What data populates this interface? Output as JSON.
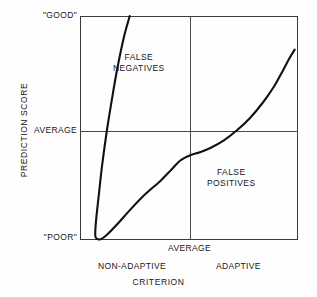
{
  "chart_data": {
    "type": "line",
    "title": "",
    "xlabel": "CRITERION",
    "ylabel": "PREDICTION SCORE",
    "x_tick_labels": [
      "NON-ADAPTIVE",
      "AVERAGE",
      "ADAPTIVE"
    ],
    "y_tick_labels": [
      "\"GOOD\"",
      "AVERAGE",
      "\"POOR\""
    ],
    "xlim": [
      0,
      1
    ],
    "ylim": [
      0,
      1
    ],
    "grid": true,
    "grid_description": "single horizontal line at y=AVERAGE and single vertical line at x=AVERAGE dividing plot into four quadrants",
    "legend": null,
    "annotations": [
      {
        "text": "FALSE NEGATIVES",
        "quadrant": "upper-left"
      },
      {
        "text": "FALSE POSITIVES",
        "quadrant": "lower-right"
      }
    ],
    "series": [
      {
        "name": "prediction-criterion relation",
        "description": "J-shaped / U-shaped curve: steeply descending left branch from top of plot down to a minimum just above the lower-left corner, then rising gradually through the lower-left quadrant, flattening at a shoulder near the vertical AVERAGE line, crossing the horizontal AVERAGE line in the right half, then rising steeply to the upper-right.",
        "points": [
          {
            "x": 0.228,
            "y": 1.0
          },
          {
            "x": 0.2,
            "y": 0.9
          },
          {
            "x": 0.17,
            "y": 0.76
          },
          {
            "x": 0.145,
            "y": 0.62
          },
          {
            "x": 0.122,
            "y": 0.48
          },
          {
            "x": 0.101,
            "y": 0.33
          },
          {
            "x": 0.085,
            "y": 0.19
          },
          {
            "x": 0.073,
            "y": 0.08
          },
          {
            "x": 0.07,
            "y": 0.02
          },
          {
            "x": 0.078,
            "y": 0.005
          },
          {
            "x": 0.096,
            "y": 0.004
          },
          {
            "x": 0.125,
            "y": 0.025
          },
          {
            "x": 0.175,
            "y": 0.075
          },
          {
            "x": 0.235,
            "y": 0.14
          },
          {
            "x": 0.3,
            "y": 0.205
          },
          {
            "x": 0.37,
            "y": 0.265
          },
          {
            "x": 0.42,
            "y": 0.315
          },
          {
            "x": 0.46,
            "y": 0.355
          },
          {
            "x": 0.505,
            "y": 0.378
          },
          {
            "x": 0.55,
            "y": 0.392
          },
          {
            "x": 0.6,
            "y": 0.412
          },
          {
            "x": 0.66,
            "y": 0.445
          },
          {
            "x": 0.72,
            "y": 0.49
          },
          {
            "x": 0.78,
            "y": 0.545
          },
          {
            "x": 0.84,
            "y": 0.615
          },
          {
            "x": 0.89,
            "y": 0.685
          },
          {
            "x": 0.93,
            "y": 0.755
          },
          {
            "x": 0.96,
            "y": 0.81
          },
          {
            "x": 0.985,
            "y": 0.85
          }
        ]
      }
    ],
    "colors": {
      "curve": "#111111",
      "frame": "#3b3b3b",
      "gridline": "#4a4a4a",
      "background": "#fefefe",
      "text": "#161616"
    }
  },
  "axes": {
    "y_title": "PREDICTION SCORE",
    "x_title": "CRITERION",
    "y_ticks": {
      "good": "\"GOOD\"",
      "average": "AVERAGE",
      "poor": "\"POOR\""
    },
    "x_ticks": {
      "average": "AVERAGE",
      "non_adaptive": "NON-ADAPTIVE",
      "adaptive": "ADAPTIVE"
    }
  },
  "annotations": {
    "false_negatives": {
      "line1": "FALSE",
      "line2": "NEGATIVES"
    },
    "false_positives": {
      "line1": "FALSE",
      "line2": "POSITIVES"
    }
  }
}
